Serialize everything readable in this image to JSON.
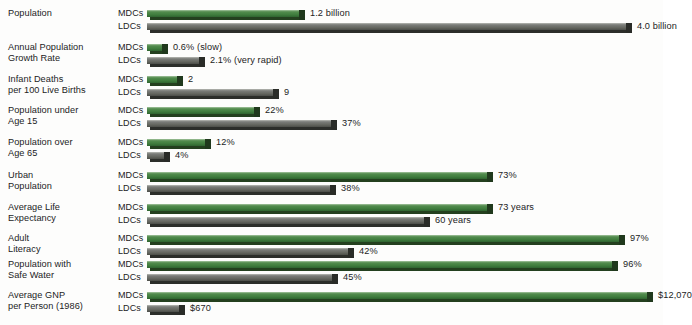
{
  "chart_data": {
    "type": "bar",
    "title": "",
    "xlabel": "",
    "ylabel": "",
    "orientation": "horizontal",
    "grid": false,
    "legend_position": "inline-row-labels",
    "group_labels": [
      "MDCs",
      "LDCs"
    ],
    "series": [
      {
        "name": "MDCs",
        "color": "#3f7c3d"
      },
      {
        "name": "LDCs",
        "color": "#64665f"
      }
    ],
    "categories": [
      "Population",
      "Annual Population Growth Rate",
      "Infant Deaths per 100 Live Births",
      "Population under Age 15",
      "Population over Age 65",
      "Urban Population",
      "Average Life Expectancy",
      "Adult Literacy",
      "Population with Safe Water",
      "Average GNP per Person (1986)"
    ],
    "rows": [
      {
        "label_line1": "Population",
        "label_line2": "",
        "mdc": {
          "value": 1.2,
          "display": "1.2 billion",
          "unit": "billion",
          "bar_px": 152
        },
        "ldc": {
          "value": 4.0,
          "display": "4.0 billion",
          "unit": "billion",
          "bar_px": 479
        }
      },
      {
        "label_line1": "Annual Population",
        "label_line2": "Growth Rate",
        "mdc": {
          "value": 0.6,
          "display": "0.6%  (slow)",
          "unit": "%",
          "bar_px": 15
        },
        "ldc": {
          "value": 2.1,
          "display": "2.1% (very rapid)",
          "unit": "%",
          "bar_px": 52
        }
      },
      {
        "label_line1": "Infant Deaths",
        "label_line2": "per 100 Live Births",
        "mdc": {
          "value": 2,
          "display": "2",
          "unit": "deaths",
          "bar_px": 30
        },
        "ldc": {
          "value": 9,
          "display": "9",
          "unit": "deaths",
          "bar_px": 126
        }
      },
      {
        "label_line1": "Population under",
        "label_line2": "Age 15",
        "mdc": {
          "value": 22,
          "display": "22%",
          "unit": "%",
          "bar_px": 107
        },
        "ldc": {
          "value": 37,
          "display": "37%",
          "unit": "%",
          "bar_px": 184
        }
      },
      {
        "label_line1": "Population over",
        "label_line2": "Age 65",
        "mdc": {
          "value": 12,
          "display": "12%",
          "unit": "%",
          "bar_px": 58
        },
        "ldc": {
          "value": 4,
          "display": "4%",
          "unit": "%",
          "bar_px": 17
        }
      },
      {
        "label_line1": "Urban",
        "label_line2": "Population",
        "mdc": {
          "value": 73,
          "display": "73%",
          "unit": "%",
          "bar_px": 340
        },
        "ldc": {
          "value": 38,
          "display": "38%",
          "unit": "%",
          "bar_px": 183
        }
      },
      {
        "label_line1": "Average Life",
        "label_line2": "Expectancy",
        "mdc": {
          "value": 73,
          "display": "73 years",
          "unit": "years",
          "bar_px": 340
        },
        "ldc": {
          "value": 60,
          "display": "60 years",
          "unit": "years",
          "bar_px": 277
        }
      },
      {
        "label_line1": "Adult",
        "label_line2": "Literacy",
        "mdc": {
          "value": 97,
          "display": "97%",
          "unit": "%",
          "bar_px": 472
        },
        "ldc": {
          "value": 42,
          "display": "42%",
          "unit": "%",
          "bar_px": 201
        }
      },
      {
        "label_line1": "Population with",
        "label_line2": "Safe Water",
        "mdc": {
          "value": 96,
          "display": "96%",
          "unit": "%",
          "bar_px": 465
        },
        "ldc": {
          "value": 45,
          "display": "45%",
          "unit": "%",
          "bar_px": 185
        }
      },
      {
        "label_line1": "Average GNP",
        "label_line2": "per Person (1986)",
        "mdc": {
          "value": 12070,
          "display": "$12,070",
          "unit": "USD",
          "bar_px": 500
        },
        "ldc": {
          "value": 670,
          "display": "$670",
          "unit": "USD",
          "bar_px": 32
        }
      }
    ]
  },
  "colors": {
    "mdc_green": "#3f7c3d",
    "ldc_gray": "#64665f",
    "background": "#fdfdfc",
    "text": "#1c1c1c"
  }
}
